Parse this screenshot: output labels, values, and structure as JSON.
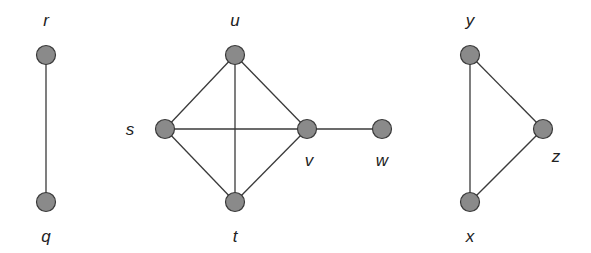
{
  "diagram": {
    "type": "undirected-graph",
    "components": 3,
    "nodes": [
      {
        "id": "r",
        "label": "r",
        "x": 46,
        "y": 55,
        "lx": 46,
        "ly": 26
      },
      {
        "id": "q",
        "label": "q",
        "x": 46,
        "y": 202,
        "lx": 46,
        "ly": 242
      },
      {
        "id": "u",
        "label": "u",
        "x": 235,
        "y": 55,
        "lx": 235,
        "ly": 26
      },
      {
        "id": "s",
        "label": "s",
        "x": 165,
        "y": 129,
        "lx": 130,
        "ly": 135
      },
      {
        "id": "v",
        "label": "v",
        "x": 307,
        "y": 129,
        "lx": 309,
        "ly": 166
      },
      {
        "id": "w",
        "label": "w",
        "x": 382,
        "y": 129,
        "lx": 382,
        "ly": 166
      },
      {
        "id": "t",
        "label": "t",
        "x": 235,
        "y": 202,
        "lx": 235,
        "ly": 242
      },
      {
        "id": "y",
        "label": "y",
        "x": 470,
        "y": 55,
        "lx": 470,
        "ly": 26
      },
      {
        "id": "z",
        "label": "z",
        "x": 543,
        "y": 129,
        "lx": 556,
        "ly": 162
      },
      {
        "id": "x",
        "label": "x",
        "x": 470,
        "y": 202,
        "lx": 470,
        "ly": 242
      }
    ],
    "edges": [
      [
        "r",
        "q"
      ],
      [
        "u",
        "s"
      ],
      [
        "u",
        "v"
      ],
      [
        "u",
        "t"
      ],
      [
        "s",
        "v"
      ],
      [
        "s",
        "t"
      ],
      [
        "t",
        "v"
      ],
      [
        "v",
        "w"
      ],
      [
        "y",
        "z"
      ],
      [
        "y",
        "x"
      ],
      [
        "x",
        "z"
      ]
    ],
    "colors": {
      "node_fill": "#8a8a8a",
      "node_stroke": "#3a3a3a",
      "edge": "#3a3a3a",
      "label": "#222222"
    }
  }
}
